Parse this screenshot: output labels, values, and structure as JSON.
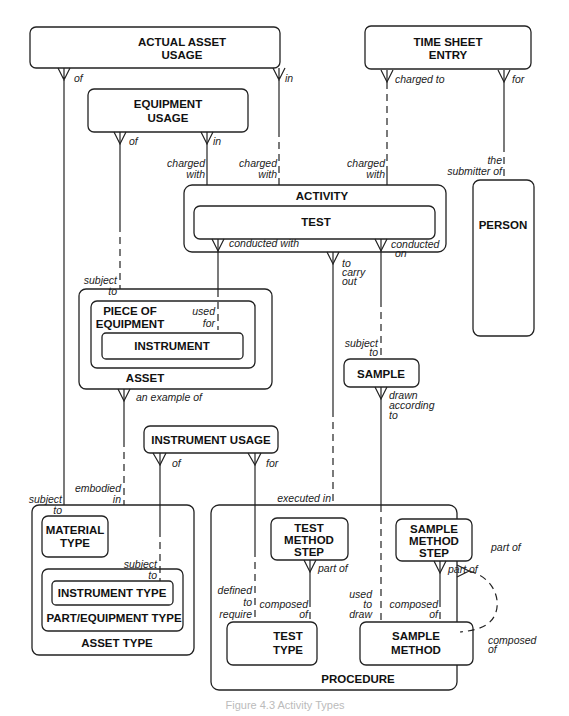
{
  "diagram": {
    "type": "entity-relationship",
    "entities": {
      "actual_asset_usage": [
        "ACTUAL ASSET",
        "USAGE"
      ],
      "time_sheet_entry": [
        "TIME SHEET",
        "ENTRY"
      ],
      "equipment_usage": [
        "EQUIPMENT",
        "USAGE"
      ],
      "activity": "ACTIVITY",
      "test": "TEST",
      "person": "PERSON",
      "asset": "ASSET",
      "piece_of_equipment": [
        "PIECE OF",
        "EQUIPMENT"
      ],
      "instrument": "INSTRUMENT",
      "sample": "SAMPLE",
      "instrument_usage": "INSTRUMENT USAGE",
      "asset_type": "ASSET TYPE",
      "material_type": [
        "MATERIAL",
        "TYPE"
      ],
      "part_equipment_type": "PART/EQUIPMENT TYPE",
      "instrument_type": "INSTRUMENT TYPE",
      "procedure": "PROCEDURE",
      "test_method_step": [
        "TEST",
        "METHOD",
        "STEP"
      ],
      "sample_method_step": [
        "SAMPLE",
        "METHOD",
        "STEP"
      ],
      "test_type": [
        "TEST",
        "TYPE"
      ],
      "sample_method": [
        "SAMPLE",
        "METHOD"
      ]
    },
    "relationships": {
      "aau_of": "of",
      "aau_in": "in",
      "tse_charged_to": "charged to",
      "tse_for": "for",
      "eu_of": "of",
      "eu_in": "in",
      "charged_with_1": [
        "charged",
        "with"
      ],
      "charged_with_2": [
        "charged",
        "with"
      ],
      "charged_with_3": [
        "charged",
        "with"
      ],
      "the_submitter_of": [
        "the",
        "submitter of"
      ],
      "conducted_with": "conducted with",
      "conducted_on": [
        "conducted",
        "on"
      ],
      "to_carry_out": [
        "to",
        "carry",
        "out"
      ],
      "subject_to_asset": [
        "subject",
        "to"
      ],
      "used_for": [
        "used",
        "for"
      ],
      "subject_to_sample": [
        "subject",
        "to"
      ],
      "an_example_of": "an example of",
      "drawn_according_to": [
        "drawn",
        "according",
        "to"
      ],
      "iu_of": "of",
      "iu_for": "for",
      "embodied_in": [
        "embodied",
        "in"
      ],
      "subject_to_material": [
        "subject",
        "to"
      ],
      "executed_in": "executed in",
      "subject_to_instrument": [
        "subject",
        "to"
      ],
      "defined_to_require": [
        "defined",
        "to",
        "require"
      ],
      "tms_part_of": "part of",
      "sms_part_of": "part of",
      "tt_composed_of": [
        "composed",
        "of"
      ],
      "used_to_draw": [
        "used",
        "to",
        "draw"
      ],
      "sm_composed_of": [
        "composed",
        "of"
      ],
      "proc_part_of": "part of",
      "proc_composed_of": [
        "composed",
        "of"
      ]
    },
    "caption": "Figure 4.3  Activity Types"
  }
}
